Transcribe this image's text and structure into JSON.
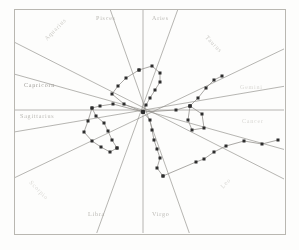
{
  "figure": {
    "kind": "zodiac-radial-scatter-chart",
    "medium": "scanned print, grayscale, faded",
    "border_color": "#b9b7b1",
    "line_color": "#8e8c87",
    "marker_color": "#2d2d2d",
    "label_color": "#9a9892",
    "paper_color": "#fdfdfc"
  },
  "zodiac": {
    "signs": [
      {
        "name": "Pisces",
        "slot": "top-left-inner",
        "x": 96,
        "y": 16,
        "rotate": 0,
        "tone": "faint"
      },
      {
        "name": "Aries",
        "slot": "top-right-inner",
        "x": 152,
        "y": 16,
        "rotate": 0,
        "tone": "faint"
      },
      {
        "name": "Aquarius",
        "slot": "upper-left-corner",
        "x": 44,
        "y": 38,
        "rotate": -46,
        "tone": "fainter"
      },
      {
        "name": "Taurus",
        "slot": "upper-right-corner",
        "x": 208,
        "y": 35,
        "rotate": 46,
        "tone": "fainter"
      },
      {
        "name": "Capricorn",
        "slot": "left-upper",
        "x": 24,
        "y": 83,
        "rotate": 0,
        "tone": "normal"
      },
      {
        "name": "Gemini",
        "slot": "right-upper",
        "x": 240,
        "y": 85,
        "rotate": 0,
        "tone": "ghost"
      },
      {
        "name": "Sagittarius",
        "slot": "left-lower",
        "x": 20,
        "y": 114,
        "rotate": 0,
        "tone": "faint"
      },
      {
        "name": "Cancer",
        "slot": "right-lower",
        "x": 242,
        "y": 119,
        "rotate": 0,
        "tone": "ghost"
      },
      {
        "name": "Scorpio",
        "slot": "lower-left-corner",
        "x": 32,
        "y": 180,
        "rotate": 46,
        "tone": "ghost"
      },
      {
        "name": "Leo",
        "slot": "lower-right-corner",
        "x": 220,
        "y": 186,
        "rotate": -46,
        "tone": "ghost"
      },
      {
        "name": "Libra",
        "slot": "bottom-left-inner",
        "x": 88,
        "y": 212,
        "rotate": 0,
        "tone": "faint"
      },
      {
        "name": "Virgo",
        "slot": "bottom-right-inner",
        "x": 152,
        "y": 212,
        "rotate": 0,
        "tone": "faint"
      }
    ]
  },
  "chart_data": {
    "type": "scatter",
    "title": "",
    "xlabel": "",
    "ylabel": "",
    "center": {
      "x": 143,
      "y": 112
    },
    "axis_note": "twelve radial house-cusp lines radiate from the chart centre; labels name the zodiac sector between adjacent cusps",
    "radial_lines": [
      {
        "name": "cusp-vertical",
        "x1": 143,
        "y1": 9,
        "x2": 143,
        "y2": 235
      },
      {
        "name": "cusp-horizontal",
        "x1": 14,
        "y1": 110,
        "x2": 286,
        "y2": 110
      },
      {
        "name": "cusp-aquarius-leo",
        "x1": 14,
        "y1": 42,
        "x2": 286,
        "y2": 180
      },
      {
        "name": "cusp-taurus-scorpio",
        "x1": 286,
        "y1": 48,
        "x2": 14,
        "y2": 178
      },
      {
        "name": "cusp-pisces-virgo",
        "x1": 110,
        "y1": 9,
        "x2": 190,
        "y2": 235
      },
      {
        "name": "cusp-aries-libra",
        "x1": 178,
        "y1": 9,
        "x2": 96,
        "y2": 235
      },
      {
        "name": "cusp-capricorn-cancer",
        "x1": 14,
        "y1": 74,
        "x2": 286,
        "y2": 150
      },
      {
        "name": "cusp-gemini-sagit",
        "x1": 286,
        "y1": 86,
        "x2": 14,
        "y2": 132
      }
    ],
    "series": [
      {
        "name": "upper-loop-path",
        "points": [
          [
            139,
            70
          ],
          [
            152,
            66
          ],
          [
            160,
            73
          ],
          [
            160,
            82
          ],
          [
            155,
            90
          ],
          [
            150,
            98
          ],
          [
            146,
            105
          ],
          [
            143,
            112
          ]
        ]
      },
      {
        "name": "upper-left-path",
        "points": [
          [
            139,
            70
          ],
          [
            126,
            78
          ],
          [
            118,
            86
          ],
          [
            112,
            94
          ],
          [
            124,
            104
          ],
          [
            143,
            112
          ]
        ]
      },
      {
        "name": "left-chain-path",
        "points": [
          [
            143,
            112
          ],
          [
            113,
            104
          ],
          [
            100,
            106
          ],
          [
            92,
            108
          ],
          [
            96,
            116
          ],
          [
            104,
            123
          ],
          [
            108,
            131
          ],
          [
            112,
            140
          ],
          [
            117,
            148
          ]
        ]
      },
      {
        "name": "left-outer-path",
        "points": [
          [
            92,
            108
          ],
          [
            88,
            121
          ],
          [
            84,
            132
          ],
          [
            92,
            141
          ],
          [
            101,
            147
          ],
          [
            110,
            152
          ],
          [
            117,
            148
          ]
        ]
      },
      {
        "name": "lower-centre-path",
        "points": [
          [
            143,
            112
          ],
          [
            150,
            120
          ],
          [
            152,
            130
          ],
          [
            154,
            140
          ],
          [
            157,
            149
          ],
          [
            160,
            158
          ],
          [
            157,
            168
          ],
          [
            163,
            176
          ]
        ]
      },
      {
        "name": "right-upper-curve",
        "points": [
          [
            143,
            112
          ],
          [
            176,
            110
          ],
          [
            190,
            106
          ],
          [
            198,
            98
          ],
          [
            206,
            88
          ],
          [
            214,
            80
          ],
          [
            222,
            76
          ]
        ]
      },
      {
        "name": "right-quad-loop",
        "points": [
          [
            190,
            106
          ],
          [
            188,
            120
          ],
          [
            192,
            130
          ],
          [
            204,
            128
          ],
          [
            202,
            114
          ],
          [
            190,
            106
          ]
        ]
      },
      {
        "name": "lower-right-trail",
        "points": [
          [
            163,
            176
          ],
          [
            196,
            162
          ],
          [
            204,
            159
          ],
          [
            214,
            152
          ],
          [
            226,
            146
          ],
          [
            244,
            141
          ],
          [
            262,
            144
          ],
          [
            278,
            140
          ]
        ]
      }
    ]
  }
}
